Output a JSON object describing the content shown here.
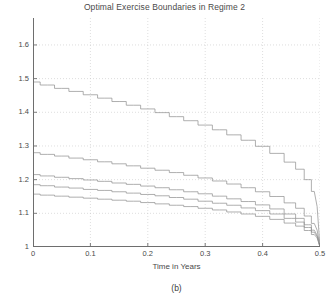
{
  "chart_data": {
    "type": "line",
    "title": "Optimal Exercise Boundaries in Regime 2",
    "xlabel": "Time in Years",
    "ylabel": "Stock Price (Y)",
    "caption": "(b)",
    "xlim": [
      0,
      0.5
    ],
    "ylim": [
      1,
      1.68
    ],
    "xticks": [
      0,
      0.1,
      0.2,
      0.3,
      0.4,
      0.5
    ],
    "xtick_labels": [
      "0",
      "0.1",
      "0.2",
      "0.3",
      "0.4",
      "0.5"
    ],
    "yticks": [
      1,
      1.1,
      1.2,
      1.3,
      1.4,
      1.5,
      1.6
    ],
    "ytick_labels": [
      "1",
      "1.1",
      "1.2",
      "1.3",
      "1.4",
      "1.5",
      "1.6"
    ],
    "grid": true,
    "grid_style": "dotted",
    "grid_color": "#c8c8c8",
    "line_color": "#8c8c8c",
    "axis_color": "#6e6e6e",
    "background": "#ffffff",
    "legend": null,
    "x": [
      0,
      0.025,
      0.05,
      0.075,
      0.1,
      0.125,
      0.15,
      0.175,
      0.2,
      0.225,
      0.25,
      0.275,
      0.3,
      0.325,
      0.35,
      0.375,
      0.4,
      0.425,
      0.45,
      0.465,
      0.48,
      0.49,
      0.495,
      0.5
    ],
    "series": [
      {
        "name": "boundary-1",
        "values": [
          1.49,
          1.481,
          1.471,
          1.462,
          1.452,
          1.442,
          1.432,
          1.421,
          1.41,
          1.399,
          1.387,
          1.375,
          1.362,
          1.348,
          1.333,
          1.317,
          1.299,
          1.278,
          1.252,
          1.231,
          1.2,
          1.165,
          1.12,
          1.0
        ]
      },
      {
        "name": "boundary-2",
        "values": [
          1.28,
          1.275,
          1.27,
          1.264,
          1.259,
          1.253,
          1.247,
          1.241,
          1.234,
          1.228,
          1.221,
          1.213,
          1.205,
          1.196,
          1.187,
          1.176,
          1.164,
          1.15,
          1.131,
          1.115,
          1.092,
          1.07,
          1.05,
          1.0
        ]
      },
      {
        "name": "boundary-3",
        "values": [
          1.215,
          1.211,
          1.207,
          1.203,
          1.199,
          1.195,
          1.19,
          1.186,
          1.181,
          1.176,
          1.17,
          1.164,
          1.158,
          1.151,
          1.143,
          1.135,
          1.125,
          1.113,
          1.098,
          1.085,
          1.066,
          1.05,
          1.035,
          1.0
        ]
      },
      {
        "name": "boundary-4",
        "values": [
          1.185,
          1.182,
          1.178,
          1.175,
          1.171,
          1.168,
          1.164,
          1.16,
          1.156,
          1.152,
          1.147,
          1.142,
          1.136,
          1.13,
          1.124,
          1.116,
          1.108,
          1.098,
          1.085,
          1.074,
          1.058,
          1.044,
          1.031,
          1.0
        ]
      },
      {
        "name": "boundary-5",
        "values": [
          1.157,
          1.154,
          1.151,
          1.148,
          1.145,
          1.142,
          1.139,
          1.136,
          1.132,
          1.128,
          1.124,
          1.12,
          1.115,
          1.11,
          1.104,
          1.098,
          1.091,
          1.082,
          1.071,
          1.062,
          1.049,
          1.037,
          1.027,
          1.0
        ]
      }
    ]
  }
}
